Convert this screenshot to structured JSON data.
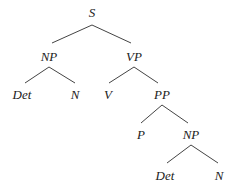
{
  "diagram": {
    "type": "syntax-tree",
    "nodes": [
      {
        "id": "s",
        "label": "S",
        "x": 92,
        "y": 17
      },
      {
        "id": "np1",
        "label": "NP",
        "x": 49,
        "y": 61
      },
      {
        "id": "vp",
        "label": "VP",
        "x": 134,
        "y": 61
      },
      {
        "id": "det1",
        "label": "Det",
        "x": 22,
        "y": 99
      },
      {
        "id": "n1",
        "label": "N",
        "x": 75,
        "y": 99
      },
      {
        "id": "v",
        "label": "V",
        "x": 108,
        "y": 99
      },
      {
        "id": "pp",
        "label": "PP",
        "x": 162,
        "y": 99
      },
      {
        "id": "p",
        "label": "P",
        "x": 141,
        "y": 139
      },
      {
        "id": "np2",
        "label": "NP",
        "x": 191,
        "y": 139
      },
      {
        "id": "det2",
        "label": "Det",
        "x": 165,
        "y": 180
      },
      {
        "id": "n2",
        "label": "N",
        "x": 219,
        "y": 180
      }
    ],
    "edges": [
      {
        "from": "s",
        "to": "np1",
        "x1": 92,
        "y1": 25,
        "x2": 52,
        "y2": 43
      },
      {
        "from": "s",
        "to": "vp",
        "x1": 92,
        "y1": 25,
        "x2": 131,
        "y2": 43
      },
      {
        "from": "np1",
        "to": "det1",
        "x1": 49,
        "y1": 67,
        "x2": 25,
        "y2": 83
      },
      {
        "from": "np1",
        "to": "n1",
        "x1": 49,
        "y1": 67,
        "x2": 75,
        "y2": 83
      },
      {
        "from": "vp",
        "to": "v",
        "x1": 134,
        "y1": 67,
        "x2": 109,
        "y2": 83
      },
      {
        "from": "vp",
        "to": "pp",
        "x1": 134,
        "y1": 67,
        "x2": 158,
        "y2": 83
      },
      {
        "from": "pp",
        "to": "p",
        "x1": 162,
        "y1": 105,
        "x2": 141,
        "y2": 123
      },
      {
        "from": "pp",
        "to": "np2",
        "x1": 162,
        "y1": 105,
        "x2": 188,
        "y2": 123
      },
      {
        "from": "np2",
        "to": "det2",
        "x1": 191,
        "y1": 145,
        "x2": 167,
        "y2": 163
      },
      {
        "from": "np2",
        "to": "n2",
        "x1": 191,
        "y1": 145,
        "x2": 218,
        "y2": 163
      }
    ],
    "colors": {
      "background": "#ffffff",
      "text": "#222222",
      "edge": "#444444"
    }
  }
}
